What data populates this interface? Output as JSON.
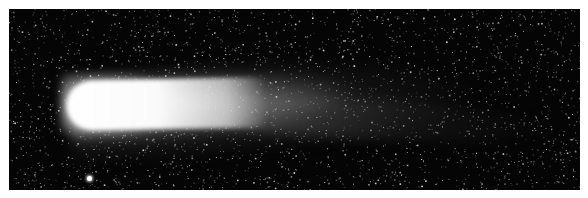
{
  "image": {
    "subject": "comet",
    "description": "Black-and-white photograph of a comet with a bright coma at left and a diffuse tail extending to the right against a star field",
    "colors": {
      "background": "#ffffff",
      "sky": "#050505",
      "coma": "#ffffff",
      "stars": "#d8d8d8"
    }
  }
}
